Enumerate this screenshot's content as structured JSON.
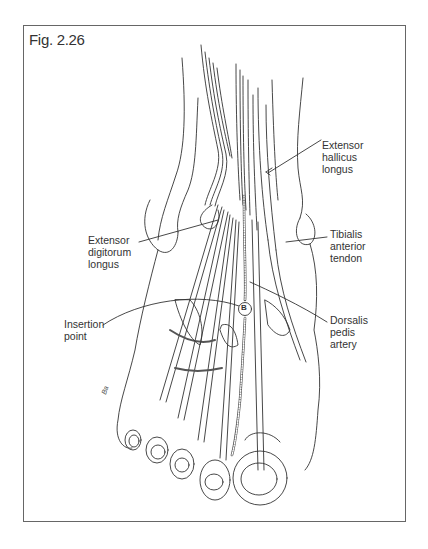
{
  "figure": {
    "title": "Fig. 2.26",
    "frame_color": "#666666",
    "line_color": "#333333"
  },
  "labels": [
    {
      "id": "extensor-hallucis-longus",
      "lines": [
        "Extensor",
        "hallicus",
        "longus"
      ],
      "x": 322,
      "y": 139
    },
    {
      "id": "extensor-digitorum-longus",
      "lines": [
        "Extensor",
        "digitorum",
        "longus"
      ],
      "x": 88,
      "y": 234
    },
    {
      "id": "tibialis-anterior-tendon",
      "lines": [
        "Tibialis",
        "anterior",
        "tendon"
      ],
      "x": 330,
      "y": 228
    },
    {
      "id": "insertion-point",
      "lines": [
        "Insertion",
        "point"
      ],
      "x": 64,
      "y": 318
    },
    {
      "id": "dorsalis-pedis-artery",
      "lines": [
        "Dorsalis",
        "pedis",
        "artery"
      ],
      "x": 330,
      "y": 314
    }
  ],
  "markers": [
    {
      "id": "circle-b",
      "text": "B",
      "x": 245,
      "y": 309
    }
  ],
  "signature": "Ba"
}
